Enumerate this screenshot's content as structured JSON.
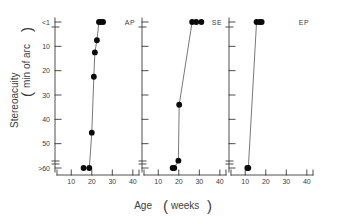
{
  "figure": {
    "x_axis_title_main": "Age",
    "x_axis_title_paren_open": "(",
    "x_axis_title_unit": "weeks",
    "x_axis_title_paren_close": ")",
    "y_axis_title_main": "Stereoacuity",
    "y_axis_title_paren_open": "(",
    "y_axis_title_unit": "min of arc",
    "y_axis_title_paren_close": ")"
  },
  "chart_data": {
    "type": "scatter",
    "title": "",
    "xlabel": "Age (weeks)",
    "ylabel": "Stereoacuity (min of arc)",
    "xlim": [
      5,
      43
    ],
    "ylim_display_top": "<1",
    "ylim_display_bottom": ">=60",
    "y_inverted": true,
    "x_ticks": [
      10,
      20,
      30,
      40
    ],
    "x_tick_labels": [
      "10",
      "20",
      "30",
      "40"
    ],
    "y_ticks": [
      1,
      10,
      20,
      30,
      40,
      50,
      60
    ],
    "y_tick_labels": [
      "<1",
      "10",
      "20",
      "30",
      "40",
      "50",
      ">60"
    ],
    "grid": false,
    "legend": "none",
    "panels": [
      {
        "name": "AP",
        "label": "AP",
        "connected": true,
        "points": [
          {
            "x": 16.0,
            "y": 60
          },
          {
            "x": 18.8,
            "y": 60
          },
          {
            "x": 20.0,
            "y": 45.5
          },
          {
            "x": 21.0,
            "y": 22.5
          },
          {
            "x": 21.5,
            "y": 12.5
          },
          {
            "x": 22.5,
            "y": 7.5
          },
          {
            "x": 23.5,
            "y": 1
          },
          {
            "x": 24.5,
            "y": 1
          },
          {
            "x": 25.5,
            "y": 1
          }
        ]
      },
      {
        "name": "SE",
        "label": "SE",
        "connected": true,
        "points": [
          {
            "x": 17.0,
            "y": 60
          },
          {
            "x": 17.8,
            "y": 60
          },
          {
            "x": 19.8,
            "y": 57
          },
          {
            "x": 20.2,
            "y": 34
          },
          {
            "x": 26.5,
            "y": 1
          },
          {
            "x": 28.5,
            "y": 1
          },
          {
            "x": 31.0,
            "y": 1
          }
        ]
      },
      {
        "name": "EP",
        "label": "EP",
        "connected": true,
        "points": [
          {
            "x": 11.0,
            "y": 60
          },
          {
            "x": 11.5,
            "y": 60
          },
          {
            "x": 15.5,
            "y": 1
          },
          {
            "x": 17.0,
            "y": 1
          },
          {
            "x": 18.0,
            "y": 1
          }
        ]
      }
    ]
  }
}
